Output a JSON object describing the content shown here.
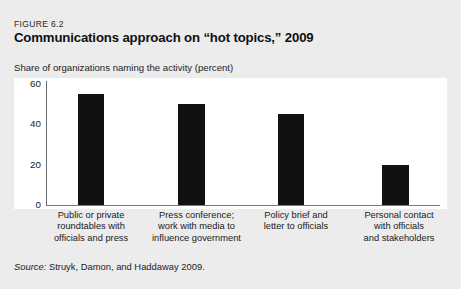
{
  "figure": {
    "number": "FIGURE 6.2",
    "title": "Communications approach on “hot topics,” 2009",
    "subtitle": "Share of organizations naming the activity (percent)",
    "source_label": "Source:",
    "source_text": " Struyk, Damon, and Haddaway 2009."
  },
  "chart_data": {
    "type": "bar",
    "title": "Communications approach on “hot topics,” 2009",
    "subtitle": "Share of organizations naming the activity (percent)",
    "xlabel": "",
    "ylabel": "Share of organizations naming the activity (percent)",
    "ylim": [
      0,
      60
    ],
    "yticks": [
      0,
      20,
      40,
      60
    ],
    "ytick_labels": [
      "0",
      "20",
      "40",
      "60"
    ],
    "grid": false,
    "legend": false,
    "bar_color": "#111113",
    "categories": [
      "Public or private roundtables with officials and press",
      "Press conference; work with media to influence government",
      "Policy brief and letter to officials",
      "Personal contact with officials and stakeholders"
    ],
    "category_lines": [
      [
        "Public or private",
        "roundtables with",
        "officials and press"
      ],
      [
        "Press conference;",
        "work with media to",
        "influence government"
      ],
      [
        "Policy brief and",
        "letter to officials"
      ],
      [
        "Personal contact",
        "with officials",
        "and stakeholders"
      ]
    ],
    "values": [
      55,
      50,
      45,
      20
    ]
  }
}
